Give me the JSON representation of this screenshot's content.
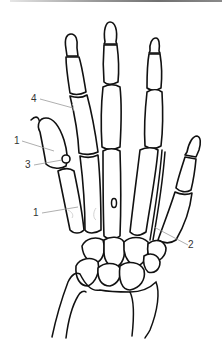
{
  "figure": {
    "colors": {
      "line": "#111111",
      "leader": "#9a9a9a",
      "label": "#333333",
      "background": "#ffffff"
    }
  },
  "labels": [
    {
      "id": "label-4",
      "text": "4",
      "x": 33,
      "y": 97
    },
    {
      "id": "label-1-upper",
      "text": "1",
      "x": 16,
      "y": 139
    },
    {
      "id": "label-3",
      "text": "3",
      "x": 27,
      "y": 163
    },
    {
      "id": "label-1-lower",
      "text": "1",
      "x": 35,
      "y": 211
    },
    {
      "id": "label-2",
      "text": "2",
      "x": 190,
      "y": 243
    }
  ]
}
